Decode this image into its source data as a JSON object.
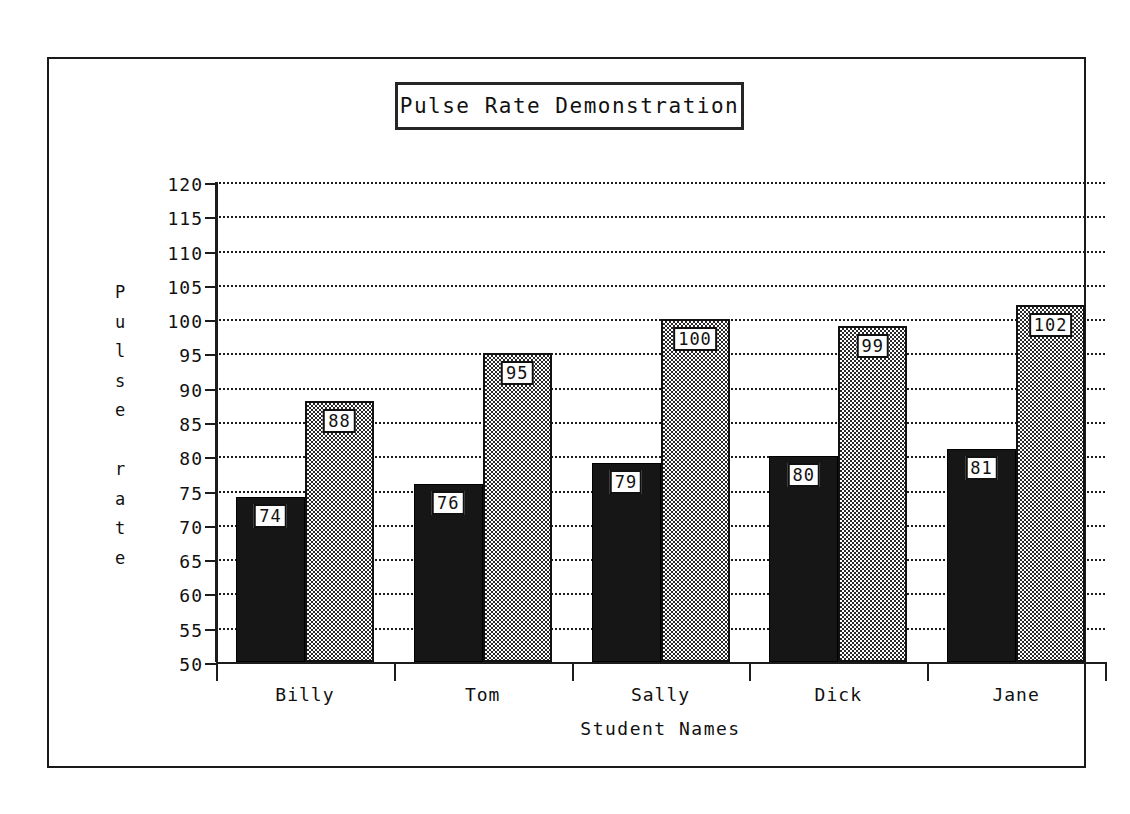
{
  "chart_data": {
    "type": "bar",
    "title": "Pulse Rate Demonstration",
    "xlabel": "Student Names",
    "ylabel": "Pulse rate",
    "categories": [
      "Billy",
      "Tom",
      "Sally",
      "Dick",
      "Jane"
    ],
    "series": [
      {
        "name": "resting",
        "style": "solid-black",
        "values": [
          74,
          76,
          79,
          80,
          81
        ]
      },
      {
        "name": "after exercise",
        "style": "checkered-gray",
        "values": [
          88,
          95,
          100,
          99,
          102
        ]
      }
    ],
    "ylim": [
      50,
      120
    ],
    "ytick_step": 5,
    "yticks": [
      120,
      115,
      110,
      105,
      100,
      95,
      90,
      85,
      80,
      75,
      70,
      65,
      60,
      55,
      50
    ],
    "grid": true,
    "grid_style": "dotted-horizontal",
    "legend": "none",
    "data_labels": true,
    "colors": {
      "ink": "#1a1a1a",
      "background": "#ffffff",
      "series_1": "#161616",
      "series_2": "#808080"
    }
  },
  "ylabel_chars": [
    "P",
    "u",
    "l",
    "s",
    "e",
    " ",
    "r",
    "a",
    "t",
    "e"
  ],
  "bar_labels": {
    "billy_dark": "74",
    "billy_gray": "88",
    "tom_dark": "76",
    "tom_gray": "95",
    "sally_dark": "79",
    "sally_gray": "100",
    "dick_dark": "80",
    "dick_gray": "99",
    "jane_dark": "81",
    "jane_gray": "102"
  }
}
